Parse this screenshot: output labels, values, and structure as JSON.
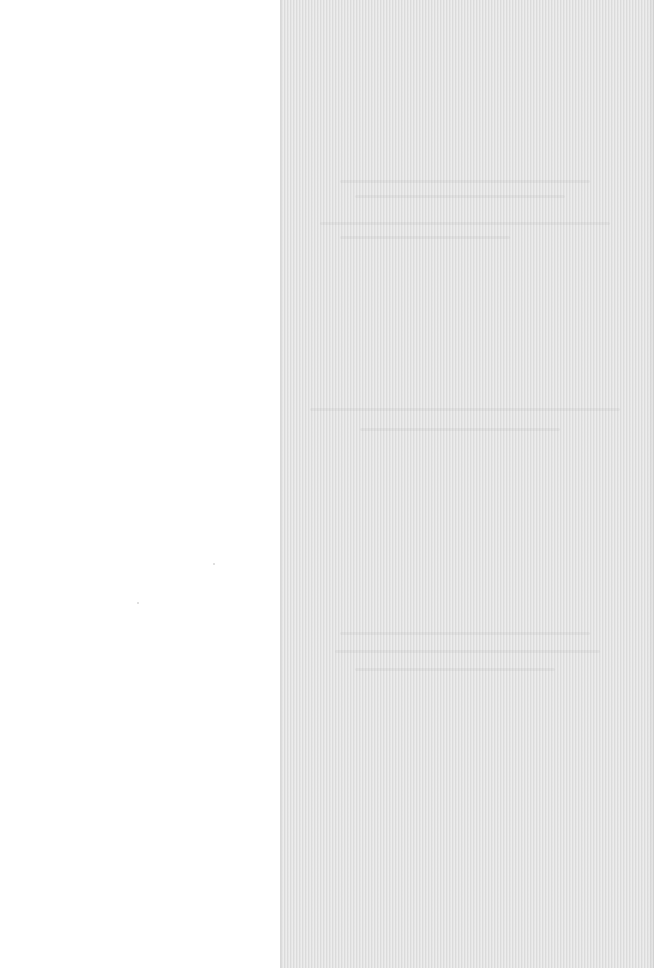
{
  "page": {
    "colors": {
      "left_background": "#ffffff",
      "panel_background": "#e3e3e3"
    }
  },
  "panel": {
    "ghost_lines": [
      {
        "top": 180,
        "left": 60,
        "width": 250
      },
      {
        "top": 195,
        "left": 75,
        "width": 210
      },
      {
        "top": 222,
        "left": 40,
        "width": 290
      },
      {
        "top": 236,
        "left": 60,
        "width": 170
      },
      {
        "top": 408,
        "left": 30,
        "width": 310
      },
      {
        "top": 428,
        "left": 80,
        "width": 200
      },
      {
        "top": 632,
        "left": 60,
        "width": 250
      },
      {
        "top": 650,
        "left": 55,
        "width": 265
      },
      {
        "top": 668,
        "left": 75,
        "width": 200
      }
    ]
  }
}
